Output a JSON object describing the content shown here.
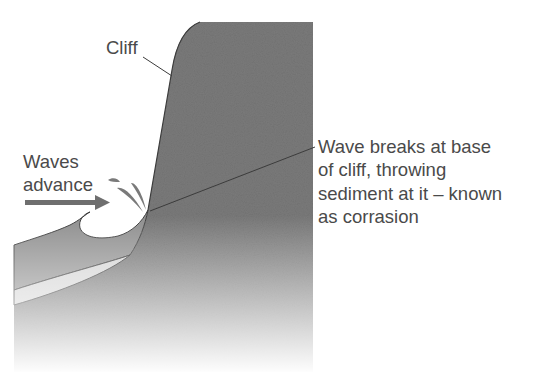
{
  "diagram": {
    "topic": "Coastal erosion - corrasion",
    "labels": {
      "cliff": "Cliff",
      "waves_line1": "Waves",
      "waves_line2": "advance",
      "corrasion_lines": [
        "Wave breaks at base",
        "of cliff, throwing",
        "sediment at it – known",
        "as corrasion"
      ]
    },
    "colors": {
      "cliff": "#7c7c7c",
      "water": "#8f8f8f",
      "sand": "#d4d4d4",
      "outline": "#3c3c3c",
      "arrow": "#6f6f6f",
      "text": "#4a4a4a",
      "background": "#ffffff"
    }
  }
}
